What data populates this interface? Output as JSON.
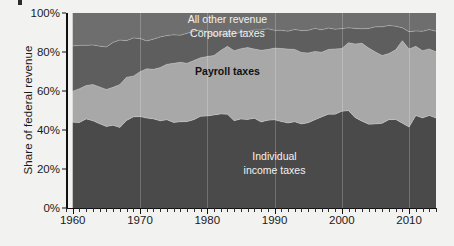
{
  "chart_data": {
    "type": "area",
    "stacked": true,
    "normalized": true,
    "title": "",
    "xlabel": "",
    "ylabel": "Share of federal revenue",
    "xlim": [
      1959,
      2014
    ],
    "ylim": [
      0,
      100
    ],
    "grid": false,
    "legend_position": "inline-annotations",
    "y_ticks": [
      "0%",
      "20%",
      "40%",
      "60%",
      "80%",
      "100%"
    ],
    "y_tick_values": [
      0,
      20,
      40,
      60,
      80,
      100
    ],
    "x_ticks": [
      "1960",
      "1970",
      "1980",
      "1990",
      "2000",
      "2010"
    ],
    "x_tick_values": [
      1960,
      1970,
      1980,
      1990,
      2000,
      2010
    ],
    "x_minor_tick_step": 1,
    "colors": {
      "individual_income_taxes": "#4a4a4a",
      "payroll_taxes": "#a8a8a8",
      "corporate_taxes": "#5e5e5e",
      "all_other_revenue": "#6e6e6e",
      "background": "#f2f2f0",
      "axis": "#111111"
    },
    "x": [
      1960,
      1961,
      1962,
      1963,
      1964,
      1965,
      1966,
      1967,
      1968,
      1969,
      1970,
      1971,
      1972,
      1973,
      1974,
      1975,
      1976,
      1977,
      1978,
      1979,
      1980,
      1981,
      1982,
      1983,
      1984,
      1985,
      1986,
      1987,
      1988,
      1989,
      1990,
      1991,
      1992,
      1993,
      1994,
      1995,
      1996,
      1997,
      1998,
      1999,
      2000,
      2001,
      2002,
      2003,
      2004,
      2005,
      2006,
      2007,
      2008,
      2009,
      2010,
      2011,
      2012,
      2013,
      2014
    ],
    "series": [
      {
        "name": "Individual income taxes",
        "label": "Individual\nincome taxes",
        "values": [
          44.0,
          43.8,
          45.7,
          44.7,
          43.2,
          41.8,
          42.4,
          41.3,
          44.9,
          46.7,
          46.9,
          46.1,
          45.7,
          44.7,
          45.2,
          43.9,
          44.2,
          44.3,
          45.3,
          47.0,
          47.2,
          47.7,
          48.2,
          48.1,
          44.8,
          45.6,
          45.4,
          46.0,
          44.1,
          45.0,
          45.2,
          44.3,
          43.6,
          44.2,
          43.1,
          43.7,
          45.2,
          46.7,
          48.1,
          48.1,
          49.6,
          49.9,
          46.3,
          44.5,
          43.0,
          43.1,
          43.4,
          45.3,
          45.4,
          43.5,
          41.5,
          47.4,
          46.2,
          47.4,
          46.2
        ]
      },
      {
        "name": "Payroll taxes",
        "label": "Payroll taxes",
        "values": [
          15.9,
          17.4,
          17.1,
          18.6,
          18.9,
          19.0,
          19.5,
          22.0,
          22.2,
          20.9,
          23.0,
          25.3,
          25.4,
          27.3,
          28.5,
          30.3,
          30.5,
          29.9,
          30.3,
          30.0,
          30.5,
          30.5,
          32.6,
          34.8,
          35.9,
          36.1,
          36.9,
          35.5,
          36.8,
          36.3,
          36.8,
          37.5,
          37.9,
          37.1,
          36.7,
          35.8,
          35.1,
          33.2,
          33.2,
          33.5,
          32.2,
          34.9,
          37.8,
          40.0,
          39.0,
          36.9,
          34.8,
          33.9,
          35.7,
          42.3,
          40.0,
          35.5,
          34.5,
          34.2,
          33.9
        ]
      },
      {
        "name": "Corporate taxes",
        "label": "Corporate taxes",
        "values": [
          23.2,
          22.2,
          20.6,
          20.3,
          20.9,
          21.8,
          23.0,
          22.8,
          18.7,
          19.6,
          17.0,
          14.3,
          15.5,
          15.7,
          14.7,
          14.6,
          13.9,
          15.4,
          15.0,
          14.2,
          12.5,
          10.2,
          8.0,
          6.2,
          8.5,
          8.4,
          8.2,
          9.8,
          10.4,
          10.6,
          9.1,
          9.3,
          9.2,
          10.2,
          11.2,
          11.6,
          11.8,
          11.5,
          11.0,
          10.1,
          10.2,
          7.6,
          8.0,
          7.4,
          10.1,
          12.9,
          14.7,
          14.4,
          12.1,
          6.6,
          8.9,
          7.9,
          9.9,
          9.9,
          10.6
        ]
      },
      {
        "name": "All other revenue",
        "label": "All other revenue",
        "values": [
          16.9,
          16.6,
          16.6,
          16.4,
          17.0,
          17.4,
          15.1,
          13.9,
          14.2,
          12.8,
          13.1,
          14.3,
          13.4,
          12.3,
          11.6,
          11.2,
          11.4,
          10.4,
          9.4,
          8.8,
          9.8,
          11.6,
          11.2,
          10.9,
          10.8,
          9.9,
          9.5,
          8.7,
          8.7,
          8.1,
          8.9,
          8.9,
          9.3,
          8.5,
          9.0,
          8.9,
          7.9,
          8.6,
          7.7,
          8.3,
          8.0,
          7.6,
          7.9,
          8.1,
          7.9,
          7.1,
          7.1,
          6.4,
          6.8,
          7.6,
          9.6,
          9.2,
          9.4,
          8.5,
          9.3
        ]
      }
    ],
    "annotations": [
      {
        "text": "All other revenue",
        "x": 1983,
        "y_pct": 96.5,
        "style": "light"
      },
      {
        "text": "Corporate taxes",
        "x": 1983,
        "y_pct": 89.0,
        "style": "light"
      },
      {
        "text": "Payroll taxes",
        "x": 1983,
        "y_pct": 70.0,
        "style": "dark"
      },
      {
        "text": "Individual",
        "x": 1990,
        "y_pct": 26.0,
        "style": "light"
      },
      {
        "text": "income taxes",
        "x": 1990,
        "y_pct": 19.0,
        "style": "light"
      }
    ]
  }
}
